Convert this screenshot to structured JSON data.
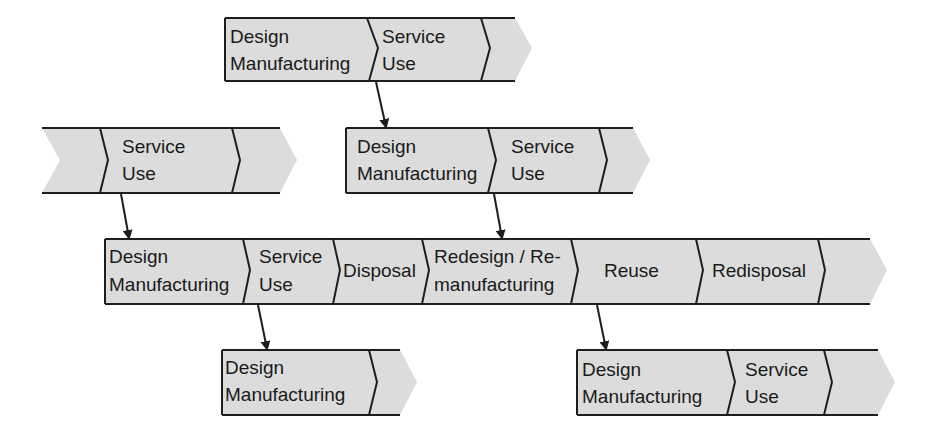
{
  "diagram": {
    "type": "product-lifecycle-chains",
    "colors": {
      "fill": "#dcdcdc",
      "stroke": "#1e1e1e",
      "text": "#1a1a1a",
      "background": "#ffffff"
    },
    "chains": [
      {
        "id": "top",
        "segments": [
          {
            "line1": "Design",
            "line2": "Manufacturing"
          },
          {
            "line1": "Service",
            "line2": "Use"
          },
          {
            "line1": "",
            "line2": ""
          }
        ]
      },
      {
        "id": "upper-left",
        "segments": [
          {
            "line1": "",
            "line2": ""
          },
          {
            "line1": "Service",
            "line2": "Use"
          },
          {
            "line1": "",
            "line2": ""
          }
        ]
      },
      {
        "id": "upper-middle",
        "segments": [
          {
            "line1": "Design",
            "line2": "Manufacturing"
          },
          {
            "line1": "Service",
            "line2": "Use"
          },
          {
            "line1": "",
            "line2": ""
          }
        ]
      },
      {
        "id": "main",
        "segments": [
          {
            "line1": "Design",
            "line2": "Manufacturing"
          },
          {
            "line1": "Service",
            "line2": "Use"
          },
          {
            "line1": "Disposal",
            "line2": ""
          },
          {
            "line1": "Redesign / Re-",
            "line2": "manufacturing"
          },
          {
            "line1": "Reuse",
            "line2": ""
          },
          {
            "line1": "Redisposal",
            "line2": ""
          },
          {
            "line1": "",
            "line2": ""
          }
        ]
      },
      {
        "id": "bottom-left",
        "segments": [
          {
            "line1": "Design",
            "line2": "Manufacturing"
          },
          {
            "line1": "",
            "line2": ""
          }
        ]
      },
      {
        "id": "bottom-right",
        "segments": [
          {
            "line1": "Design",
            "line2": "Manufacturing"
          },
          {
            "line1": "Service",
            "line2": "Use"
          },
          {
            "line1": "",
            "line2": ""
          }
        ]
      }
    ],
    "arrows": [
      {
        "from": "top.Service Use",
        "to": "upper-middle"
      },
      {
        "from": "upper-left.Service Use",
        "to": "main"
      },
      {
        "from": "upper-middle.Service Use",
        "to": "main"
      },
      {
        "from": "main.Service Use",
        "to": "bottom-left"
      },
      {
        "from": "main.Reuse",
        "to": "bottom-right"
      }
    ]
  }
}
